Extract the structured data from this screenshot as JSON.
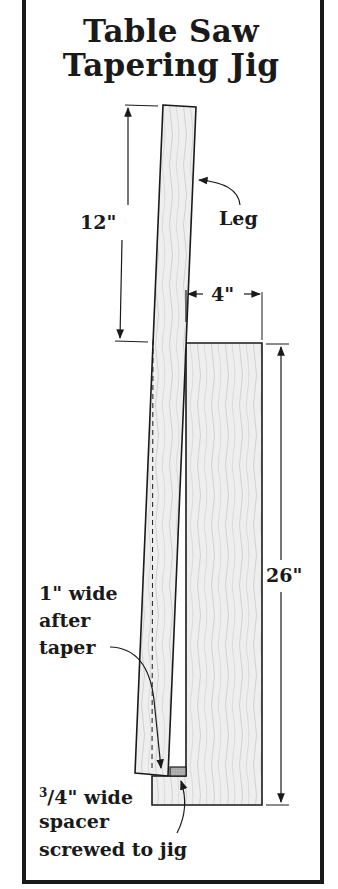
{
  "title": {
    "line1": "Table Saw",
    "line2": "Tapering Jig"
  },
  "labels": {
    "leg": "Leg",
    "dim_12": "12\"",
    "dim_4": "4\"",
    "dim_26": "26\"",
    "taper_line1": "1\" wide",
    "taper_line2": "after",
    "taper_line3": "taper",
    "spacer_fraction_num": "3",
    "spacer_fraction_rest": "/4\" wide",
    "spacer_line2": "spacer",
    "spacer_line3": "screwed to jig"
  },
  "colors": {
    "ink": "#1a1a1a",
    "wood": "#ececec",
    "grain": "#b8b8b8",
    "spacer": "#a8a8a8"
  }
}
